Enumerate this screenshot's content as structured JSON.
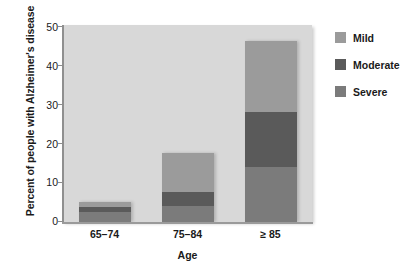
{
  "chart_data": {
    "type": "bar",
    "stacked": true,
    "title": "",
    "xlabel": "Age",
    "ylabel": "Percent of people with Alzheimer's disease",
    "categories": [
      "65–74",
      "75–84",
      "≥ 85"
    ],
    "ylim": [
      0,
      50
    ],
    "yticks": [
      0,
      10,
      20,
      30,
      40,
      50
    ],
    "ytick_labels": [
      "0",
      "10",
      "20",
      "30",
      "40",
      "50"
    ],
    "grid": false,
    "legend_position": "right",
    "series": [
      {
        "name": "Mild",
        "color": "#9b9b9b",
        "values": [
          1.3,
          9.8,
          18.0
        ]
      },
      {
        "name": "Moderate",
        "color": "#5a5a5a",
        "values": [
          1.3,
          3.6,
          14.0
        ]
      },
      {
        "name": "Severe",
        "color": "#7b7b7b",
        "values": [
          2.6,
          4.0,
          14.0
        ]
      }
    ],
    "totals": [
      5.2,
      17.4,
      46.0
    ]
  },
  "axes": {
    "y_title": "Percent of people with Alzheimer's disease",
    "x_title": "Age",
    "y_ticks": [
      "50",
      "40",
      "30",
      "20",
      "10",
      "0"
    ],
    "x_ticks": [
      "65–74",
      "75–84",
      "≥ 85"
    ]
  },
  "legend": {
    "items": [
      {
        "label": "Mild",
        "color": "#9b9b9b"
      },
      {
        "label": "Moderate",
        "color": "#5a5a5a"
      },
      {
        "label": "Severe",
        "color": "#7b7b7b"
      }
    ]
  },
  "colors": {
    "plot_background": "#d8d8d8",
    "page_background": "#ffffff",
    "text": "#1a1a1a",
    "axis": "#8f8f8f"
  }
}
